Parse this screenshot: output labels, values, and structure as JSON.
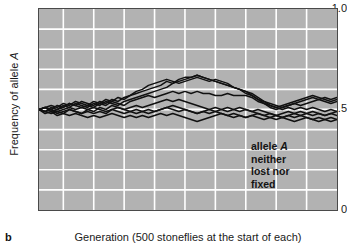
{
  "panel": {
    "letter": "b"
  },
  "axes": {
    "ylabel_prefix": "Frequency of allele ",
    "ylabel_italic": "A",
    "yticks": [
      "1.0",
      "0.5",
      "0"
    ],
    "xticks": [
      "1",
      "5",
      "10",
      "15",
      "20",
      "25",
      "30",
      "35",
      "40",
      "45",
      "50"
    ],
    "xlabel": "Generation (500 stoneflies at the start of each)"
  },
  "annotation": {
    "line1_prefix": "allele ",
    "line1_italic": "A",
    "line2": "neither",
    "line3": "lost nor",
    "line4": "fixed"
  },
  "style": {
    "plot_background": "#b2b2b2",
    "gridline_color": "#ffffff",
    "line_color": "#111111",
    "axis_color": "#4a4a4a",
    "text_color": "#1a1a1a"
  },
  "chart_data": {
    "type": "line",
    "title": "",
    "xlabel": "Generation (500 stoneflies at the start of each)",
    "ylabel": "Frequency of allele A",
    "xlim": [
      1,
      50
    ],
    "ylim": [
      0,
      1.0
    ],
    "grid": true,
    "grid_x_step": 5,
    "grid_y_step": 0.1,
    "legend": "none",
    "annotations": [
      "allele A neither lost nor fixed"
    ],
    "x": [
      1,
      2,
      3,
      4,
      5,
      6,
      7,
      8,
      9,
      10,
      11,
      12,
      13,
      14,
      15,
      16,
      17,
      18,
      19,
      20,
      21,
      22,
      23,
      24,
      25,
      26,
      27,
      28,
      29,
      30,
      31,
      32,
      33,
      34,
      35,
      36,
      37,
      38,
      39,
      40,
      41,
      42,
      43,
      44,
      45,
      46,
      47,
      48,
      49,
      50
    ],
    "series": [
      {
        "name": "population 1",
        "values": [
          0.5,
          0.51,
          0.52,
          0.51,
          0.53,
          0.52,
          0.54,
          0.53,
          0.52,
          0.54,
          0.53,
          0.55,
          0.54,
          0.56,
          0.55,
          0.57,
          0.58,
          0.59,
          0.6,
          0.61,
          0.62,
          0.64,
          0.63,
          0.65,
          0.66,
          0.66,
          0.67,
          0.66,
          0.65,
          0.64,
          0.63,
          0.62,
          0.61,
          0.6,
          0.59,
          0.58,
          0.56,
          0.54,
          0.53,
          0.52,
          0.51,
          0.52,
          0.53,
          0.54,
          0.55,
          0.56,
          0.55,
          0.56,
          0.55,
          0.56
        ]
      },
      {
        "name": "population 2",
        "values": [
          0.5,
          0.51,
          0.5,
          0.52,
          0.51,
          0.53,
          0.52,
          0.54,
          0.53,
          0.52,
          0.54,
          0.53,
          0.55,
          0.54,
          0.56,
          0.57,
          0.59,
          0.6,
          0.62,
          0.63,
          0.64,
          0.65,
          0.64,
          0.63,
          0.64,
          0.65,
          0.66,
          0.65,
          0.64,
          0.65,
          0.64,
          0.63,
          0.61,
          0.6,
          0.58,
          0.57,
          0.55,
          0.53,
          0.51,
          0.5,
          0.51,
          0.52,
          0.53,
          0.52,
          0.53,
          0.54,
          0.55,
          0.54,
          0.53,
          0.54
        ]
      },
      {
        "name": "population 3",
        "values": [
          0.5,
          0.49,
          0.51,
          0.5,
          0.52,
          0.51,
          0.53,
          0.52,
          0.51,
          0.53,
          0.52,
          0.54,
          0.53,
          0.52,
          0.54,
          0.55,
          0.56,
          0.57,
          0.58,
          0.59,
          0.6,
          0.61,
          0.63,
          0.64,
          0.65,
          0.66,
          0.67,
          0.66,
          0.65,
          0.64,
          0.63,
          0.62,
          0.61,
          0.6,
          0.59,
          0.57,
          0.55,
          0.54,
          0.52,
          0.51,
          0.52,
          0.53,
          0.54,
          0.55,
          0.56,
          0.57,
          0.56,
          0.55,
          0.54,
          0.55
        ]
      },
      {
        "name": "population 4",
        "values": [
          0.5,
          0.51,
          0.49,
          0.5,
          0.51,
          0.53,
          0.52,
          0.51,
          0.52,
          0.51,
          0.53,
          0.52,
          0.54,
          0.53,
          0.52,
          0.54,
          0.55,
          0.56,
          0.57,
          0.56,
          0.57,
          0.58,
          0.59,
          0.58,
          0.59,
          0.58,
          0.59,
          0.58,
          0.58,
          0.57,
          0.57,
          0.58,
          0.57,
          0.57,
          0.57,
          0.56,
          0.54,
          0.53,
          0.52,
          0.51,
          0.5,
          0.51,
          0.5,
          0.51,
          0.5,
          0.51,
          0.5,
          0.49,
          0.5,
          0.49
        ]
      },
      {
        "name": "population 5",
        "values": [
          0.5,
          0.49,
          0.5,
          0.48,
          0.49,
          0.5,
          0.49,
          0.48,
          0.5,
          0.49,
          0.51,
          0.5,
          0.52,
          0.51,
          0.5,
          0.51,
          0.52,
          0.51,
          0.52,
          0.53,
          0.54,
          0.55,
          0.54,
          0.55,
          0.54,
          0.53,
          0.52,
          0.51,
          0.5,
          0.51,
          0.5,
          0.49,
          0.5,
          0.49,
          0.5,
          0.49,
          0.48,
          0.47,
          0.48,
          0.47,
          0.46,
          0.47,
          0.48,
          0.47,
          0.48,
          0.49,
          0.48,
          0.47,
          0.48,
          0.49
        ]
      },
      {
        "name": "population 6",
        "values": [
          0.5,
          0.49,
          0.48,
          0.49,
          0.48,
          0.5,
          0.49,
          0.48,
          0.49,
          0.48,
          0.49,
          0.48,
          0.5,
          0.49,
          0.48,
          0.49,
          0.48,
          0.49,
          0.48,
          0.49,
          0.5,
          0.51,
          0.52,
          0.51,
          0.5,
          0.49,
          0.48,
          0.49,
          0.48,
          0.49,
          0.48,
          0.47,
          0.48,
          0.47,
          0.46,
          0.47,
          0.46,
          0.45,
          0.46,
          0.45,
          0.46,
          0.47,
          0.46,
          0.47,
          0.46,
          0.45,
          0.46,
          0.45,
          0.46,
          0.45
        ]
      },
      {
        "name": "population 7",
        "values": [
          0.5,
          0.48,
          0.49,
          0.47,
          0.48,
          0.47,
          0.48,
          0.47,
          0.46,
          0.47,
          0.46,
          0.47,
          0.48,
          0.47,
          0.46,
          0.47,
          0.46,
          0.47,
          0.46,
          0.47,
          0.48,
          0.47,
          0.48,
          0.47,
          0.46,
          0.45,
          0.44,
          0.45,
          0.46,
          0.47,
          0.48,
          0.47,
          0.46,
          0.47,
          0.46,
          0.47,
          0.48,
          0.47,
          0.46,
          0.47,
          0.48,
          0.49,
          0.48,
          0.49,
          0.48,
          0.47,
          0.48,
          0.47,
          0.48,
          0.47
        ]
      },
      {
        "name": "population 8",
        "values": [
          0.5,
          0.51,
          0.5,
          0.49,
          0.5,
          0.51,
          0.5,
          0.51,
          0.5,
          0.51,
          0.5,
          0.49,
          0.5,
          0.51,
          0.5,
          0.49,
          0.5,
          0.49,
          0.5,
          0.49,
          0.5,
          0.51,
          0.5,
          0.49,
          0.5,
          0.49,
          0.48,
          0.49,
          0.5,
          0.49,
          0.5,
          0.51,
          0.5,
          0.51,
          0.5,
          0.49,
          0.5,
          0.49,
          0.48,
          0.47,
          0.46,
          0.45,
          0.44,
          0.45,
          0.46,
          0.45,
          0.44,
          0.45,
          0.44,
          0.45
        ]
      }
    ]
  }
}
